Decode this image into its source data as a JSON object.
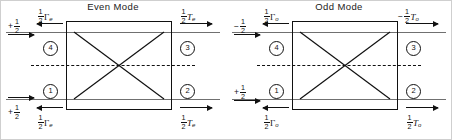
{
  "figure": {
    "kind": "even-odd-mode-decomposition-diagram",
    "panels": [
      {
        "id": "even",
        "title": "Even Mode",
        "ports": [
          {
            "id": "p4",
            "label": "4"
          },
          {
            "id": "p3",
            "label": "3"
          },
          {
            "id": "p1",
            "label": "1"
          },
          {
            "id": "p2",
            "label": "2"
          }
        ],
        "labels": {
          "top_left_incident": {
            "sign": "+",
            "num": "1",
            "den": "2",
            "symbol": "",
            "subscript": "",
            "arrow": "right"
          },
          "top_left_reflected": {
            "sign": "",
            "num": "1",
            "den": "2",
            "symbol": "Γ",
            "subscript": "e",
            "arrow": "left"
          },
          "top_right_transmitted": {
            "sign": "",
            "num": "1",
            "den": "2",
            "symbol": "T",
            "subscript": "e",
            "arrow": "right"
          },
          "bottom_left_incident": {
            "sign": "+",
            "num": "1",
            "den": "2",
            "symbol": "",
            "subscript": "",
            "arrow": "right"
          },
          "bottom_left_reflected": {
            "sign": "",
            "num": "1",
            "den": "2",
            "symbol": "Γ",
            "subscript": "e",
            "arrow": "left"
          },
          "bottom_right_transmitted": {
            "sign": "",
            "num": "1",
            "den": "2",
            "symbol": "T",
            "subscript": "e",
            "arrow": "right"
          }
        }
      },
      {
        "id": "odd",
        "title": "Odd Mode",
        "ports": [
          {
            "id": "p4",
            "label": "4"
          },
          {
            "id": "p3",
            "label": "3"
          },
          {
            "id": "p1",
            "label": "1"
          },
          {
            "id": "p2",
            "label": "2"
          }
        ],
        "labels": {
          "top_left_incident": {
            "sign": "−",
            "num": "1",
            "den": "2",
            "symbol": "",
            "subscript": "",
            "arrow": "right"
          },
          "top_left_reflected": {
            "sign": "",
            "num": "1",
            "den": "2",
            "symbol": "Γ",
            "subscript": "o",
            "arrow": "left"
          },
          "top_right_transmitted": {
            "sign": "−",
            "num": "1",
            "den": "2",
            "symbol": "T",
            "subscript": "o",
            "arrow": "right"
          },
          "bottom_left_incident": {
            "sign": "+",
            "num": "1",
            "den": "2",
            "symbol": "",
            "subscript": "",
            "arrow": "right"
          },
          "bottom_left_reflected": {
            "sign": "",
            "num": "1",
            "den": "2",
            "symbol": "Γ",
            "subscript": "o",
            "arrow": "left"
          },
          "bottom_right_transmitted": {
            "sign": "",
            "num": "1",
            "den": "2",
            "symbol": "T",
            "subscript": "o",
            "arrow": "right"
          }
        }
      }
    ],
    "colors": {
      "ink": "#111111",
      "portline": "#707070",
      "background": "#ffffff",
      "frame": "#cfcfcf"
    }
  }
}
